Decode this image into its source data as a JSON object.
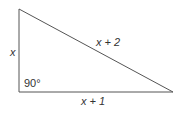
{
  "diagram": {
    "type": "right-triangle",
    "labels": {
      "left_side": "x",
      "hypotenuse": "x + 2",
      "base": "x + 1",
      "angle": "90°"
    },
    "colors": {
      "stroke": "#555555",
      "text": "#333333"
    }
  }
}
